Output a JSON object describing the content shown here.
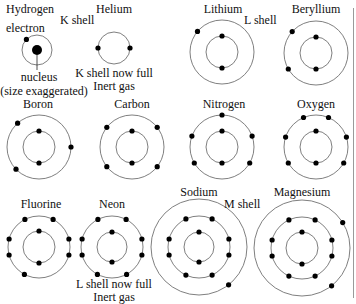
{
  "figure": {
    "colors": {
      "shell": "#707070",
      "electron": "#000000",
      "text": "#111111",
      "edge_line": "#9a9a9a"
    }
  },
  "labels": {
    "hydrogen": "Hydrogen",
    "electron": "electron",
    "k_shell": "K shell",
    "nucleus": "nucleus",
    "size_note": "(size exaggerated)",
    "helium": "Helium",
    "helium_note1": "K shell now full",
    "helium_note2": "Inert gas",
    "lithium": "Lithium",
    "l_shell": "L shell",
    "beryllium": "Beryllium",
    "boron": "Boron",
    "carbon": "Carbon",
    "nitrogen": "Nitrogen",
    "oxygen": "Oxygen",
    "fluorine": "Fluorine",
    "neon": "Neon",
    "neon_note1": "L shell now full",
    "neon_note2": "Inert gas",
    "sodium": "Sodium",
    "m_shell": "M shell",
    "magnesium": "Magnesium"
  },
  "atoms": [
    {
      "name": "Hydrogen",
      "cx": 37,
      "cy": 50,
      "shells": [
        {
          "r": 15,
          "electrons": [
            225
          ]
        }
      ],
      "nucleus": true
    },
    {
      "name": "Helium",
      "cx": 114,
      "cy": 48,
      "shells": [
        {
          "r": 16,
          "electrons": [
            180,
            0
          ]
        }
      ]
    },
    {
      "name": "Lithium",
      "cx": 222,
      "cy": 52,
      "shells": [
        {
          "r": 16,
          "electrons": [
            270,
            90
          ]
        },
        {
          "r": 32,
          "electrons": [
            220
          ]
        }
      ]
    },
    {
      "name": "Beryllium",
      "cx": 316,
      "cy": 53,
      "shells": [
        {
          "r": 16,
          "electrons": [
            270,
            90
          ]
        },
        {
          "r": 32,
          "electrons": [
            222,
            150
          ]
        }
      ]
    },
    {
      "name": "Boron",
      "cx": 39,
      "cy": 147,
      "shells": [
        {
          "r": 16,
          "electrons": [
            270,
            90
          ]
        },
        {
          "r": 32,
          "electrons": [
            228,
            0,
            136
          ]
        }
      ]
    },
    {
      "name": "Carbon",
      "cx": 132,
      "cy": 147,
      "shells": [
        {
          "r": 16,
          "electrons": [
            270,
            90
          ]
        },
        {
          "r": 32,
          "electrons": [
            218,
            322,
            142,
            38
          ]
        }
      ]
    },
    {
      "name": "Nitrogen",
      "cx": 222,
      "cy": 147,
      "shells": [
        {
          "r": 16,
          "electrons": [
            270,
            90
          ]
        },
        {
          "r": 32,
          "electrons": [
            270,
            200,
            340,
            150,
            30
          ]
        }
      ]
    },
    {
      "name": "Oxygen",
      "cx": 316,
      "cy": 147,
      "shells": [
        {
          "r": 16,
          "electrons": [
            270,
            90
          ]
        },
        {
          "r": 32,
          "electrons": [
            247,
            293,
            198,
            342,
            150,
            30
          ]
        }
      ]
    },
    {
      "name": "Fluorine",
      "cx": 39,
      "cy": 247,
      "shells": [
        {
          "r": 16,
          "electrons": [
            270,
            90
          ]
        },
        {
          "r": 31,
          "electrons": [
            243,
            297,
            195,
            345,
            165,
            15,
            118
          ]
        }
      ]
    },
    {
      "name": "Neon",
      "cx": 112,
      "cy": 247,
      "shells": [
        {
          "r": 15,
          "electrons": [
            270,
            90
          ]
        },
        {
          "r": 31,
          "electrons": [
            243,
            297,
            195,
            345,
            165,
            15,
            118,
            62
          ]
        }
      ]
    },
    {
      "name": "Sodium",
      "cx": 199,
      "cy": 247,
      "shells": [
        {
          "r": 15,
          "electrons": [
            270,
            90
          ]
        },
        {
          "r": 31,
          "electrons": [
            245,
            295,
            195,
            345,
            165,
            15,
            115,
            65
          ]
        },
        {
          "r": 48,
          "electrons": [
            52
          ]
        }
      ]
    },
    {
      "name": "Magnesium",
      "cx": 302,
      "cy": 248,
      "shells": [
        {
          "r": 16,
          "electrons": [
            270,
            90
          ]
        },
        {
          "r": 31,
          "electrons": [
            245,
            295,
            195,
            345,
            165,
            15,
            115,
            65
          ]
        },
        {
          "r": 48,
          "electrons": [
            328,
            52
          ]
        }
      ]
    }
  ]
}
